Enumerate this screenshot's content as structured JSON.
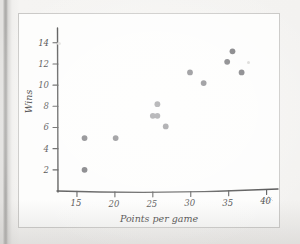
{
  "figure": {
    "kind": "scatter-plot",
    "frame_color": "#c9c8c6",
    "plot_background": "#fdfdfc",
    "point_color": "#6e6e72",
    "axis_color": "#4d4d4d"
  },
  "chart_data": {
    "type": "scatter",
    "title": "",
    "xlabel": "Points per game",
    "ylabel": "Wins",
    "xlim": [
      12.5,
      41.5
    ],
    "ylim": [
      0,
      15.4
    ],
    "xticks": [
      15,
      20,
      25,
      30,
      35,
      40
    ],
    "xtick_labels": [
      "15",
      "20",
      "25",
      "30",
      "35",
      "40"
    ],
    "yticks": [
      2,
      4,
      6,
      8,
      10,
      12,
      14
    ],
    "ytick_labels": [
      "2",
      "4",
      "6",
      "8",
      "10",
      "12",
      "14"
    ],
    "grid": false,
    "legend": null,
    "series": [
      {
        "name": "teams",
        "points": [
          {
            "x": 16.0,
            "y": 5.0
          },
          {
            "x": 16.0,
            "y": 2.0
          },
          {
            "x": 20.1,
            "y": 5.0
          },
          {
            "x": 25.0,
            "y": 7.1
          },
          {
            "x": 25.6,
            "y": 7.1
          },
          {
            "x": 25.6,
            "y": 8.2
          },
          {
            "x": 26.7,
            "y": 6.1
          },
          {
            "x": 29.9,
            "y": 11.2
          },
          {
            "x": 31.7,
            "y": 10.2
          },
          {
            "x": 34.8,
            "y": 12.2
          },
          {
            "x": 35.5,
            "y": 13.2
          },
          {
            "x": 36.7,
            "y": 11.2
          }
        ]
      }
    ]
  }
}
